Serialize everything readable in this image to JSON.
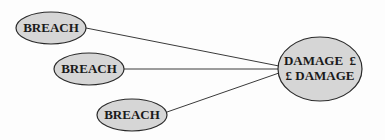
{
  "diagram": {
    "fill_color": "#d6d6d6",
    "stroke_color": "#2a2a2a",
    "source_nodes": [
      {
        "label": "BREACH",
        "cx": 51,
        "cy": 28,
        "rx": 35,
        "ry": 16
      },
      {
        "label": "BREACH",
        "cx": 89,
        "cy": 69,
        "rx": 35,
        "ry": 16
      },
      {
        "label": "BREACH",
        "cx": 132,
        "cy": 115,
        "rx": 35,
        "ry": 16
      }
    ],
    "target_node": {
      "line1": "DAMAGE  £",
      "line2": "£ DAMAGE",
      "cx": 320,
      "cy": 69,
      "rx": 42,
      "ry": 32
    },
    "edges": [
      {
        "from": 0,
        "to": "target"
      },
      {
        "from": 1,
        "to": "target"
      },
      {
        "from": 2,
        "to": "target"
      }
    ]
  }
}
